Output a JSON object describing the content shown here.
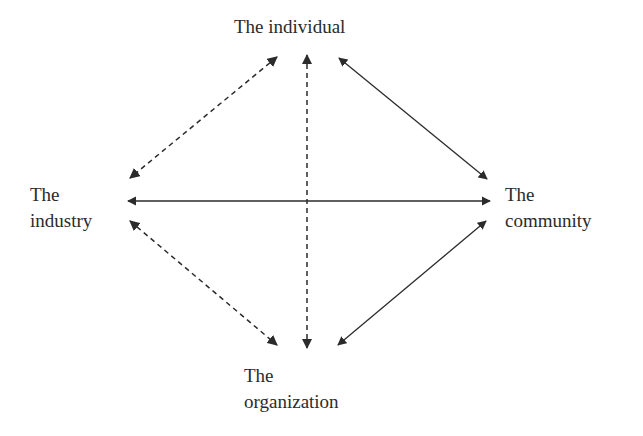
{
  "diagram": {
    "nodes": {
      "individual": {
        "line1": "The individual"
      },
      "industry": {
        "line1": "The",
        "line2": "industry"
      },
      "community": {
        "line1": "The",
        "line2": "community"
      },
      "organization": {
        "line1": "The",
        "line2": "organization"
      }
    },
    "edges": [
      {
        "from": "individual",
        "to": "industry",
        "style": "dashed",
        "bidirectional": true
      },
      {
        "from": "individual",
        "to": "organization",
        "style": "dashed",
        "bidirectional": true
      },
      {
        "from": "individual",
        "to": "community",
        "style": "solid",
        "bidirectional": true
      },
      {
        "from": "industry",
        "to": "community",
        "style": "solid",
        "bidirectional": true
      },
      {
        "from": "industry",
        "to": "organization",
        "style": "dashed",
        "bidirectional": true
      },
      {
        "from": "community",
        "to": "organization",
        "style": "solid",
        "bidirectional": true
      }
    ],
    "colors": {
      "line": "#2b2b2b",
      "text": "#2b2b2b",
      "background": "#ffffff"
    }
  }
}
